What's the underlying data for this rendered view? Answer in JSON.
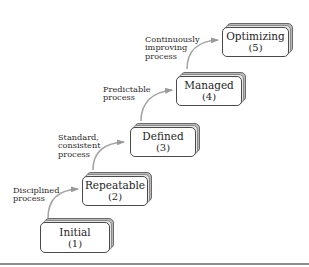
{
  "diagram": {
    "type": "capability-maturity-staircase",
    "levels": [
      {
        "name": "Initial",
        "level": "(1)"
      },
      {
        "name": "Repeatable",
        "level": "(2)"
      },
      {
        "name": "Defined",
        "level": "(3)"
      },
      {
        "name": "Managed",
        "level": "(4)"
      },
      {
        "name": "Optimizing",
        "level": "(5)"
      }
    ],
    "transitions": [
      {
        "lines": [
          "Disciplined",
          "process"
        ]
      },
      {
        "lines": [
          "Standard,",
          "consistent",
          "process"
        ]
      },
      {
        "lines": [
          "Predictable",
          "process"
        ]
      },
      {
        "lines": [
          "Continuously",
          "improving",
          "process"
        ]
      }
    ],
    "colors": {
      "box_border": "#4a4a4a",
      "box_shadow": "#b8b8b8",
      "arrow": "#a0a0a0",
      "rule": "#8e8e8e"
    }
  }
}
